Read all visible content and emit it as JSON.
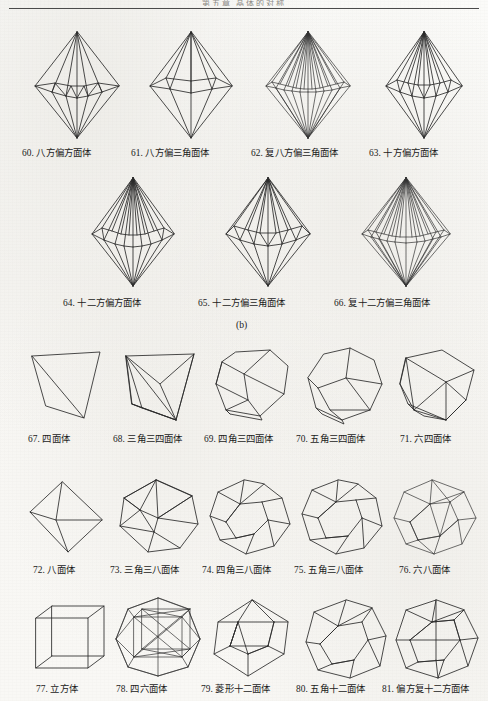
{
  "page": {
    "running_head": "第五章  晶体的对称",
    "panel_label_b": "(b)",
    "line_color": "#2b2b2b",
    "text_color": "#1a1a1a",
    "paper_color": "#f8f7f4"
  },
  "figures": [
    {
      "id": 60,
      "num": "60.",
      "name": "八方偏方面体",
      "caption": "60. 八方偏方面体",
      "row": 1,
      "col": 1,
      "shape": "ditrigonal-dipyramid-8"
    },
    {
      "id": 61,
      "num": "61.",
      "name": "八方偏三角面体",
      "caption": "61. 八方偏三角面体",
      "row": 1,
      "col": 2,
      "shape": "scalenohedron-8"
    },
    {
      "id": 62,
      "num": "62.",
      "name": "复八方偏三角面体",
      "caption": "62. 复八方偏三角面体",
      "row": 1,
      "col": 3,
      "shape": "scalenohedron-16"
    },
    {
      "id": 63,
      "num": "63.",
      "name": "十方偏方面体",
      "caption": "63. 十方偏方面体",
      "row": 1,
      "col": 4,
      "shape": "trapezohedron-10"
    },
    {
      "id": 64,
      "num": "64.",
      "name": "十二方偏方面体",
      "caption": "64. 十二方偏方面体",
      "row": 2,
      "col": 1,
      "shape": "trapezohedron-12"
    },
    {
      "id": 65,
      "num": "65.",
      "name": "十二方偏三角面体",
      "caption": "65. 十二方偏三角面体",
      "row": 2,
      "col": 2,
      "shape": "scalenohedron-12"
    },
    {
      "id": 66,
      "num": "66.",
      "name": "复十二方偏三角面体",
      "caption": "66. 复十二方偏三角面体",
      "row": 2,
      "col": 3,
      "shape": "scalenohedron-24"
    },
    {
      "id": 67,
      "num": "67.",
      "name": "四面体",
      "caption": "67. 四面体",
      "row": 3,
      "col": 1,
      "shape": "tetrahedron"
    },
    {
      "id": 68,
      "num": "68.",
      "name": "三角三四面体",
      "caption": "68. 三角三四面体",
      "row": 3,
      "col": 2,
      "shape": "triakis-tetrahedron"
    },
    {
      "id": 69,
      "num": "69.",
      "name": "四角三四面体",
      "caption": "69. 四角三四面体",
      "row": 3,
      "col": 3,
      "shape": "tetragonal-tristetrahedron"
    },
    {
      "id": 70,
      "num": "70.",
      "name": "五角三四面体",
      "caption": "70. 五角三四面体",
      "row": 3,
      "col": 4,
      "shape": "pentagonal-tristetrahedron"
    },
    {
      "id": 71,
      "num": "71.",
      "name": "六四面体",
      "caption": "71. 六四面体",
      "row": 3,
      "col": 5,
      "shape": "hextetrahedron"
    },
    {
      "id": 72,
      "num": "72.",
      "name": "八面体",
      "caption": "72. 八面体",
      "row": 4,
      "col": 1,
      "shape": "octahedron"
    },
    {
      "id": 73,
      "num": "73.",
      "name": "三角三八面体",
      "caption": "73. 三角三八面体",
      "row": 4,
      "col": 2,
      "shape": "triakis-octahedron"
    },
    {
      "id": 74,
      "num": "74.",
      "name": "四角三八面体",
      "caption": "74. 四角三八面体",
      "row": 4,
      "col": 3,
      "shape": "trapezohedron-24"
    },
    {
      "id": 75,
      "num": "75.",
      "name": "五角三八面体",
      "caption": "75. 五角三八面体",
      "row": 4,
      "col": 4,
      "shape": "pentagonal-icositetrahedron"
    },
    {
      "id": 76,
      "num": "76.",
      "name": "六八面体",
      "caption": "76. 六八面体",
      "row": 4,
      "col": 5,
      "shape": "hexoctahedron"
    },
    {
      "id": 77,
      "num": "77.",
      "name": "立方体",
      "caption": "77. 立方体",
      "row": 5,
      "col": 1,
      "shape": "cube"
    },
    {
      "id": 78,
      "num": "78.",
      "name": "四六面体",
      "caption": "78. 四六面体",
      "row": 5,
      "col": 2,
      "shape": "tetrakis-hexahedron"
    },
    {
      "id": 79,
      "num": "79.",
      "name": "菱形十二面体",
      "caption": "79. 菱形十二面体",
      "row": 5,
      "col": 3,
      "shape": "rhombic-dodecahedron"
    },
    {
      "id": 80,
      "num": "80.",
      "name": "五角十二面体",
      "caption": "80. 五角十二面体",
      "row": 5,
      "col": 4,
      "shape": "pyritohedron"
    },
    {
      "id": 81,
      "num": "81.",
      "name": "偏方复十二方面体",
      "caption": "81. 偏方复十二方面体",
      "row": 5,
      "col": 5,
      "shape": "diploid"
    }
  ]
}
